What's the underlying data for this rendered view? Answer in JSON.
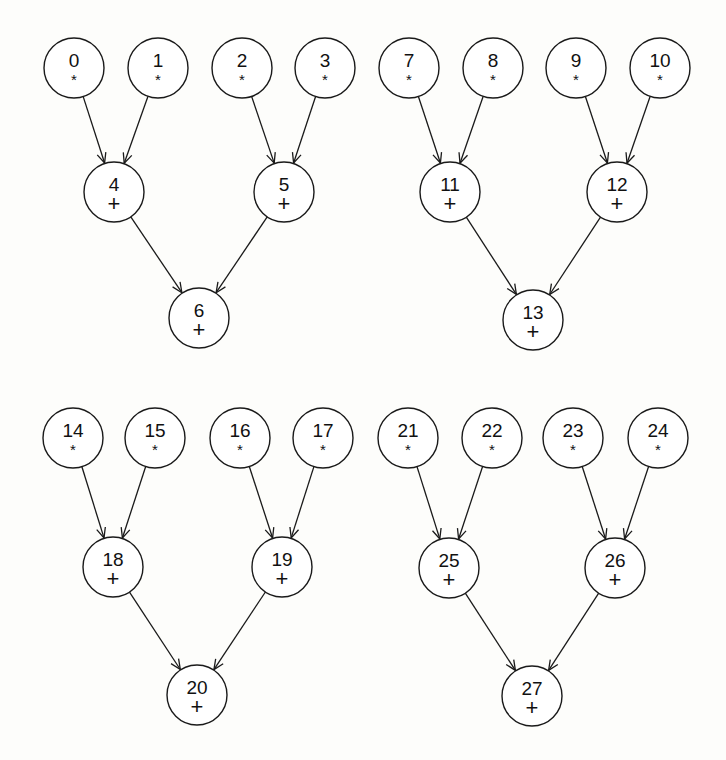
{
  "diagram": {
    "title": "",
    "node_radius": 30,
    "colors": {
      "stroke": "#1a1a1a",
      "fill": "#ffffff",
      "text": "#111111",
      "background": "#fdfdfb"
    },
    "trees": [
      {
        "name": "tree-a",
        "nodes": [
          {
            "id": "0",
            "op": "*",
            "x": 74,
            "y": 68
          },
          {
            "id": "1",
            "op": "*",
            "x": 158,
            "y": 68
          },
          {
            "id": "2",
            "op": "*",
            "x": 242,
            "y": 68
          },
          {
            "id": "3",
            "op": "*",
            "x": 325,
            "y": 68
          },
          {
            "id": "4",
            "op": "+",
            "x": 114,
            "y": 192
          },
          {
            "id": "5",
            "op": "+",
            "x": 284,
            "y": 192
          },
          {
            "id": "6",
            "op": "+",
            "x": 199,
            "y": 318
          }
        ],
        "edges": [
          [
            "0",
            "4"
          ],
          [
            "1",
            "4"
          ],
          [
            "2",
            "5"
          ],
          [
            "3",
            "5"
          ],
          [
            "4",
            "6"
          ],
          [
            "5",
            "6"
          ]
        ]
      },
      {
        "name": "tree-b",
        "nodes": [
          {
            "id": "7",
            "op": "*",
            "x": 409,
            "y": 68
          },
          {
            "id": "8",
            "op": "*",
            "x": 493,
            "y": 68
          },
          {
            "id": "9",
            "op": "*",
            "x": 576,
            "y": 68
          },
          {
            "id": "10",
            "op": "*",
            "x": 660,
            "y": 68
          },
          {
            "id": "11",
            "op": "+",
            "x": 450,
            "y": 192
          },
          {
            "id": "12",
            "op": "+",
            "x": 617,
            "y": 192
          },
          {
            "id": "13",
            "op": "+",
            "x": 533,
            "y": 320
          }
        ],
        "edges": [
          [
            "7",
            "11"
          ],
          [
            "8",
            "11"
          ],
          [
            "9",
            "12"
          ],
          [
            "10",
            "12"
          ],
          [
            "11",
            "13"
          ],
          [
            "12",
            "13"
          ]
        ]
      },
      {
        "name": "tree-c",
        "nodes": [
          {
            "id": "14",
            "op": "*",
            "x": 73,
            "y": 438
          },
          {
            "id": "15",
            "op": "*",
            "x": 155,
            "y": 438
          },
          {
            "id": "16",
            "op": "*",
            "x": 240,
            "y": 438
          },
          {
            "id": "17",
            "op": "*",
            "x": 323,
            "y": 438
          },
          {
            "id": "18",
            "op": "+",
            "x": 113,
            "y": 567
          },
          {
            "id": "19",
            "op": "+",
            "x": 282,
            "y": 567
          },
          {
            "id": "20",
            "op": "+",
            "x": 197,
            "y": 695
          }
        ],
        "edges": [
          [
            "14",
            "18"
          ],
          [
            "15",
            "18"
          ],
          [
            "16",
            "19"
          ],
          [
            "17",
            "19"
          ],
          [
            "18",
            "20"
          ],
          [
            "19",
            "20"
          ]
        ]
      },
      {
        "name": "tree-d",
        "nodes": [
          {
            "id": "21",
            "op": "*",
            "x": 408,
            "y": 438
          },
          {
            "id": "22",
            "op": "*",
            "x": 492,
            "y": 438
          },
          {
            "id": "23",
            "op": "*",
            "x": 573,
            "y": 438
          },
          {
            "id": "24",
            "op": "*",
            "x": 658,
            "y": 438
          },
          {
            "id": "25",
            "op": "+",
            "x": 449,
            "y": 568
          },
          {
            "id": "26",
            "op": "+",
            "x": 615,
            "y": 568
          },
          {
            "id": "27",
            "op": "+",
            "x": 532,
            "y": 696
          }
        ],
        "edges": [
          [
            "21",
            "25"
          ],
          [
            "22",
            "25"
          ],
          [
            "23",
            "26"
          ],
          [
            "24",
            "26"
          ],
          [
            "25",
            "27"
          ],
          [
            "26",
            "27"
          ]
        ]
      }
    ]
  }
}
